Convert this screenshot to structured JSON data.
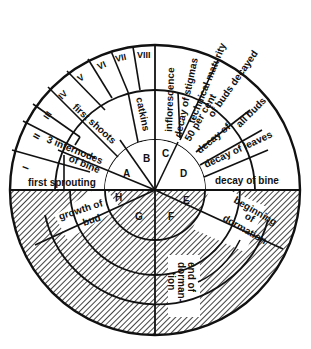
{
  "diagram": {
    "type": "circular phenology diagram (hop plant annual cycle)",
    "colors": {
      "ink": "#111111",
      "background": "#ffffff",
      "hatch": "#111111"
    },
    "sectors_inner": [
      "A",
      "B",
      "C",
      "D",
      "E",
      "F",
      "G",
      "H"
    ],
    "roman_stages": [
      "I",
      "II",
      "III",
      "IV",
      "V",
      "VI",
      "VII",
      "VIII"
    ],
    "labels": {
      "first_sprouting": "first sprouting",
      "three_internodes_1": "3 internodes",
      "three_internodes_2": "of bine",
      "first_shoots": "first shoots",
      "catkins": "catkins",
      "inflorescence": "inflorescence",
      "decay_of_stigmas": "decay of stigmas",
      "technical_maturity": "technical maturity",
      "fifty_per_cent_1": "50 per cent",
      "fifty_per_cent_2": "of buds decayed",
      "decay_of_all_buds_1": "decay of",
      "decay_of_all_buds_2": "all buds",
      "decay_of_leaves": "decay of leaves",
      "decay_of_bine": "decay of bine",
      "beginning_of_dormation_1": "beginning",
      "beginning_of_dormation_2": "of",
      "beginning_of_dormation_3": "dormation",
      "end_of_dormantion_1": "end of",
      "end_of_dormantion_2": "dorman-",
      "end_of_dormantion_3": "tion",
      "growth_of_bud_1": "growth of",
      "growth_of_bud_2": "bud"
    }
  }
}
